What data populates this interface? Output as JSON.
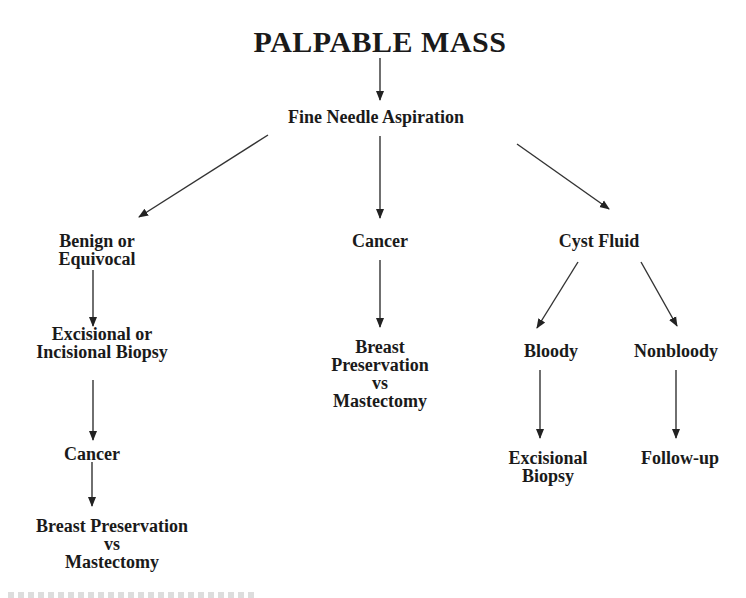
{
  "diagram": {
    "title": "PALPABLE MASS",
    "nodes": {
      "fna": {
        "lines": [
          "Fine Needle Aspiration"
        ]
      },
      "benign": {
        "lines": [
          "Benign or",
          "Equivocal"
        ]
      },
      "cancer_mid": {
        "lines": [
          "Cancer"
        ]
      },
      "cyst": {
        "lines": [
          "Cyst Fluid"
        ]
      },
      "excisional_incisional": {
        "lines": [
          "Excisional or",
          "Incisional Biopsy"
        ]
      },
      "breast_mid": {
        "lines": [
          "Breast",
          "Preservation",
          "vs",
          "Mastectomy"
        ]
      },
      "bloody": {
        "lines": [
          "Bloody"
        ]
      },
      "nonbloody": {
        "lines": [
          "Nonbloody"
        ]
      },
      "cancer_left": {
        "lines": [
          "Cancer"
        ]
      },
      "excisional_biopsy": {
        "lines": [
          "Excisional",
          "Biopsy"
        ]
      },
      "followup": {
        "lines": [
          "Follow-up"
        ]
      },
      "breast_left": {
        "lines": [
          "Breast Preservation",
          "vs",
          "Mastectomy"
        ]
      }
    },
    "edges": [
      {
        "from": "title",
        "to": "fna"
      },
      {
        "from": "fna",
        "to": "benign"
      },
      {
        "from": "fna",
        "to": "cancer_mid"
      },
      {
        "from": "fna",
        "to": "cyst"
      },
      {
        "from": "benign",
        "to": "excisional_incisional"
      },
      {
        "from": "excisional_incisional",
        "to": "cancer_left"
      },
      {
        "from": "cancer_left",
        "to": "breast_left"
      },
      {
        "from": "cancer_mid",
        "to": "breast_mid"
      },
      {
        "from": "cyst",
        "to": "bloody"
      },
      {
        "from": "cyst",
        "to": "nonbloody"
      },
      {
        "from": "bloody",
        "to": "excisional_biopsy"
      },
      {
        "from": "nonbloody",
        "to": "followup"
      }
    ],
    "colors": {
      "text": "#1a1a1a",
      "arrow": "#333333",
      "background": "#ffffff"
    }
  }
}
